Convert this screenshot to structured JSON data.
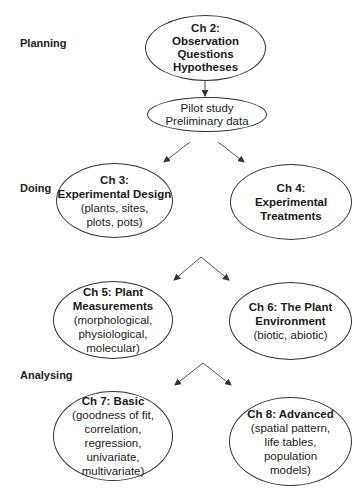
{
  "phases": {
    "planning": "Planning",
    "doing": "Doing",
    "analysing": "Analysing"
  },
  "nodes": {
    "ch2": {
      "title": "Ch 2:\nObservation\nQuestions\nHypotheses",
      "sub": ""
    },
    "pilot": {
      "title": "",
      "sub": "Pilot study\nPreliminary data"
    },
    "ch3": {
      "title": "Ch 3:\nExperimental Design",
      "sub": "(plants, sites,\nplots, pots)"
    },
    "ch4": {
      "title": "Ch 4:\nExperimental\nTreatments",
      "sub": ""
    },
    "ch5": {
      "title": "Ch 5: Plant\nMeasurements",
      "sub": "(morphological,\nphysiological,\nmolecular)"
    },
    "ch6": {
      "title": "Ch 6: The Plant\nEnvironment",
      "sub": "(biotic, abiotic)"
    },
    "ch7": {
      "title": "Ch 7: Basic",
      "sub": "(goodness of fit,\ncorrelation,\nregression,\nunivariate,\nmultivariate)"
    },
    "ch8": {
      "title": "Ch 8: Advanced",
      "sub": "(spatial pattern,\nlife tables,\npopulation\nmodels)"
    }
  },
  "edges": [
    [
      "ch2",
      "pilot"
    ],
    [
      "pilot",
      "ch3"
    ],
    [
      "pilot",
      "ch4"
    ],
    [
      "ch3/ch4",
      "ch5"
    ],
    [
      "ch3/ch4",
      "ch6"
    ],
    [
      "ch5/ch6",
      "ch7"
    ],
    [
      "ch5/ch6",
      "ch8"
    ]
  ]
}
